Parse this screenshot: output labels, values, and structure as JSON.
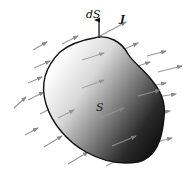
{
  "diagram": {
    "labels": {
      "surface_element": "dS",
      "current_density": "J",
      "surface": "S"
    },
    "colors": {
      "outline": "#111111",
      "arrow": "#8a8a8a",
      "shade_light": "#ffffff",
      "shade_dark": "#1a1a1a"
    },
    "arrow_direction": "up-right, approx 20-30 degrees above horizontal",
    "normal_vector_at": "top of surface"
  }
}
